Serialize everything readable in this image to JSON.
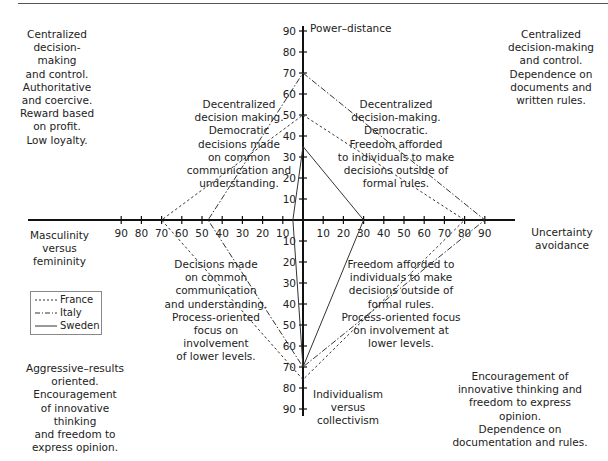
{
  "axes": {
    "power_distance": {
      "label": "Power–distance",
      "ticks": [
        "10",
        "20",
        "30",
        "40",
        "50",
        "60",
        "70",
        "80",
        "90"
      ]
    },
    "uncertainty_avoidance": {
      "label": "Uncertainty\navoidance",
      "ticks": [
        "10",
        "20",
        "30",
        "40",
        "50",
        "60",
        "70",
        "80",
        "90"
      ]
    },
    "individualism": {
      "label": "Individualism\nversus\ncollectivism",
      "ticks": [
        "10",
        "20",
        "30",
        "40",
        "50",
        "60",
        "70",
        "80",
        "90"
      ]
    },
    "masculinity": {
      "label": "Masculinity\nversus\nfemininity",
      "ticks": [
        "10",
        "20",
        "30",
        "40",
        "50",
        "60",
        "70",
        "80",
        "90"
      ]
    }
  },
  "corner_notes": {
    "top_left": "Centralized\ndecision-making\nand control.\nAuthoritative\nand coercive.\nReward based\non profit.\nLow loyalty.",
    "top_right": "Centralized\ndecision-making\nand control.\nDependence on\ndocuments and\nwritten rules.",
    "bottom_left": "Aggressive–results\noriented.\nEncouragement\nof innovative thinking\nand freedom to\nexpress opinion.",
    "bottom_right": "Encouragement of\ninnovative thinking and\nfreedom to express opinion.\nDependence on\ndocumentation and rules."
  },
  "inner_notes": {
    "upper_left": "Decentralized\ndecision making.\nDemocratic\ndecisions made\non common\ncommunication and\nunderstanding.",
    "upper_right": "Decentralized\ndecision-making.\nDemocratic.\nFreedom afforded\nto individuals to make\ndecisions outside of\nformal rules.",
    "lower_left": "Decisions made\non common\ncommunication\nand understanding.\nProcess-oriented\nfocus on involvement\nof lower levels.",
    "lower_right": "Freedom afforded to\nindividuals to make\ndecisions outside of\nformal rules.\nProcess-oriented focus\non involvement at\nlower levels."
  },
  "legend": [
    {
      "label": "France",
      "style": "dotted"
    },
    {
      "label": "Italy",
      "style": "dash-dot"
    },
    {
      "label": "Sweden",
      "style": "solid"
    }
  ],
  "chart_data": {
    "type": "radar",
    "title": "",
    "axes": [
      "Power–distance",
      "Uncertainty avoidance",
      "Individualism versus collectivism",
      "Masculinity versus femininity"
    ],
    "range": [
      0,
      90
    ],
    "grid": false,
    "legend_position": "left",
    "series": [
      {
        "name": "France",
        "values": [
          50,
          80,
          76,
          70
        ]
      },
      {
        "name": "Italy",
        "values": [
          70,
          90,
          70,
          47
        ]
      },
      {
        "name": "Sweden",
        "values": [
          35,
          30,
          70,
          5
        ]
      }
    ]
  }
}
